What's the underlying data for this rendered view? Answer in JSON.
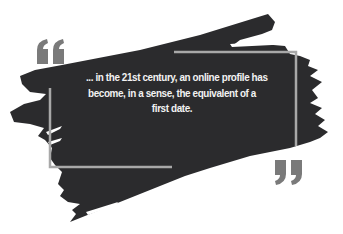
{
  "quote": {
    "lines": [
      "... in the 21st century, an online profile has",
      "become, in a sense, the equivalent of a",
      "first date."
    ]
  },
  "decor": {
    "open_quote_icon": "left-double-quote",
    "close_quote_icon": "right-double-quote",
    "frame": "bracket-frame",
    "background": "dark-brush-stroke"
  },
  "colors": {
    "background": "#ffffff",
    "brush": "#2b2b2d",
    "frame": "#a8a8a8",
    "quote_marks": "#7a7a7a",
    "text": "#f2f2f2"
  }
}
